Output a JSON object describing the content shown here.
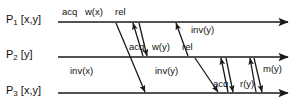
{
  "diagram": {
    "stroke_color": "#1a1a1a",
    "background_color": "#ffffff",
    "processes": [
      {
        "id": "p1",
        "name": "P",
        "subscript": "1",
        "vars": "[x,y]",
        "axis_y": 22
      },
      {
        "id": "p2",
        "name": "P",
        "subscript": "2",
        "vars": "[y]",
        "axis_y": 57
      },
      {
        "id": "p3",
        "name": "P",
        "subscript": "3",
        "vars": "[x,y]",
        "axis_y": 93
      }
    ],
    "events": [
      {
        "id": "e1",
        "label": "acq",
        "x": 70,
        "y": 13,
        "on": "p1"
      },
      {
        "id": "e2",
        "label": "w(x)",
        "x": 92,
        "y": 13,
        "on": "p1"
      },
      {
        "id": "e3",
        "label": "rel",
        "x": 121,
        "y": 13,
        "on": "p1"
      },
      {
        "id": "e4",
        "label": "inv(y)",
        "x": 196,
        "y": 27,
        "on": "p1"
      },
      {
        "id": "e5",
        "label": "acq",
        "x": 128,
        "y": 48,
        "on": "p2"
      },
      {
        "id": "e6",
        "label": "w(y)",
        "x": 153,
        "y": 48,
        "on": "p2"
      },
      {
        "id": "e7",
        "label": "rel",
        "x": 183,
        "y": 48,
        "on": "p2"
      },
      {
        "id": "e8",
        "label": "inv(x)",
        "x": 100,
        "y": 72,
        "on": "p3"
      },
      {
        "id": "e9",
        "label": "inv(y)",
        "x": 160,
        "y": 72,
        "on": "p3"
      },
      {
        "id": "e10",
        "label": "acq",
        "x": 215,
        "y": 83,
        "on": "p3"
      },
      {
        "id": "e11",
        "label": "r(y)",
        "x": 246,
        "y": 83,
        "on": "p3"
      },
      {
        "id": "e12",
        "label": "m(y)",
        "x": 270,
        "y": 70,
        "on": "p3"
      }
    ],
    "messages": [
      {
        "id": "m1",
        "label": "inv(x)",
        "from_x": 116,
        "from_y": 22,
        "to_x": 145,
        "to_y": 93
      },
      {
        "id": "m2",
        "label": "acq",
        "from_x": 143,
        "from_y": 57,
        "to_x": 133,
        "to_y": 22
      },
      {
        "id": "m3",
        "label": "w(y)",
        "from_x": 139,
        "from_y": 22,
        "to_x": 147,
        "to_y": 57
      },
      {
        "id": "m4",
        "label": "inv(y)",
        "from_x": 188,
        "from_y": 57,
        "to_x": 175,
        "to_y": 22
      },
      {
        "id": "m5",
        "label": "inv(y)",
        "from_x": 195,
        "from_y": 57,
        "to_x": 218,
        "to_y": 93
      },
      {
        "id": "m6",
        "label": "acq",
        "from_x": 228,
        "from_y": 93,
        "to_x": 221,
        "to_y": 57
      },
      {
        "id": "m7",
        "label": "r(y)",
        "from_x": 226,
        "from_y": 57,
        "to_x": 233,
        "to_y": 93
      },
      {
        "id": "m8",
        "label": "m(y)",
        "from_x": 256,
        "from_y": 93,
        "to_x": 249,
        "to_y": 57
      },
      {
        "id": "m9",
        "label": "r(y)",
        "from_x": 253,
        "from_y": 57,
        "to_x": 262,
        "to_y": 93
      }
    ],
    "axis": {
      "start_x": 58,
      "end_x": 290,
      "p3_start_x": 58,
      "p3_end_x": 290
    }
  }
}
